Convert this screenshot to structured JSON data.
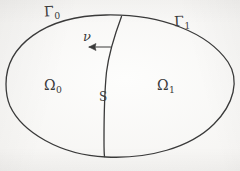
{
  "figure": {
    "background_color": "#f7f6f4",
    "ink_color": "#3a3a3a"
  },
  "labels": {
    "outer_boundary_left": {
      "base": "Γ",
      "sub": "0"
    },
    "outer_boundary_right": {
      "base": "Γ",
      "sub": "1"
    },
    "normal_vector": {
      "base": "ν",
      "sub": ""
    },
    "subdomain_left": {
      "base": "Ω",
      "sub": "0"
    },
    "subdomain_right": {
      "base": "Ω",
      "sub": "1"
    },
    "interface": {
      "base": "S",
      "sub": ""
    }
  },
  "geometry": {
    "outer_boundary": {
      "name": "closed-oval-outline",
      "path": "M 6,84 C 6,46 44,16 106,15 C 162,14 208,33 228,62 C 240,80 234,104 214,124 C 190,148 148,159 106,157 C 60,155 22,132 10,106 C 7,99 6,91 6,84 Z",
      "stroke_width": 1.3
    },
    "interface_curve": {
      "name": "interior-dividing-curve",
      "path": "M 121.5,16.5 C 115,34 109,52 106.5,72 C 104.5,92 104,118 104,140 C 104,148 104,153 104.5,156.5",
      "stroke_width": 1.3
    },
    "normal_arrow": {
      "name": "outward-normal-arrow",
      "shaft": "M 110.5,47 L 89,47",
      "head": "M 89,47 L 96,43.5 L 95,47 L 96,50.5 Z",
      "direction": "left",
      "stroke_width": 1.2
    }
  }
}
